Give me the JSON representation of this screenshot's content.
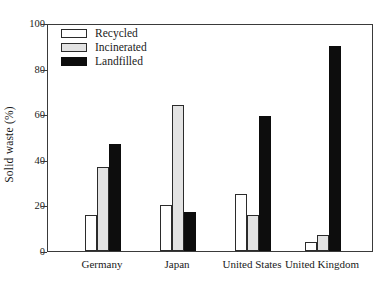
{
  "chart_data": {
    "type": "bar",
    "title": "",
    "xlabel": "",
    "ylabel": "Solid waste (%)",
    "ylim": [
      0,
      100
    ],
    "yticks": [
      0,
      20,
      40,
      60,
      80,
      100
    ],
    "grid": false,
    "legend_position": "top-left",
    "categories": [
      "Germany",
      "Japan",
      "United States",
      "United Kingdom"
    ],
    "series": [
      {
        "name": "Recycled",
        "color": "#ffffff",
        "values": [
          16,
          20,
          25,
          4
        ]
      },
      {
        "name": "Incinerated",
        "color": "#e3e3e3",
        "values": [
          37,
          64,
          16,
          7
        ]
      },
      {
        "name": "Landfilled",
        "color": "#0d0d0d",
        "values": [
          47,
          17,
          59,
          90
        ]
      }
    ]
  },
  "axis": {
    "y_title": "Solid waste (%)",
    "y_tick_labels": [
      "0",
      "20",
      "40",
      "60",
      "80",
      "100"
    ]
  }
}
